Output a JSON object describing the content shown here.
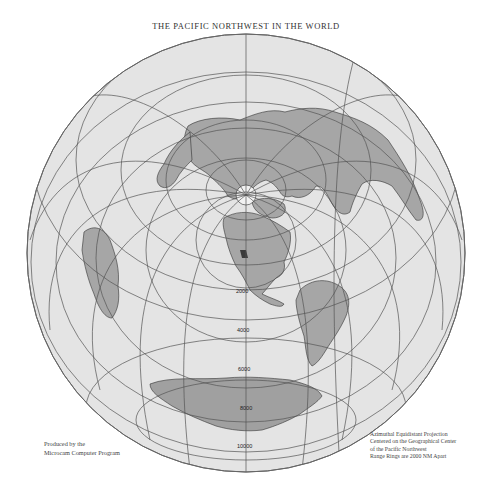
{
  "title": "THE PACIFIC NORTHWEST IN THE WORLD",
  "credit": {
    "line1": "Produced by the",
    "line2": "Microcam Computer Program"
  },
  "legend": {
    "line1": "Azimuthal Equidistant Projection",
    "line2": "Centered on the Geographical Center",
    "line3": "of the Pacific Northwest",
    "line4": "Range Rings are 2000 NM Apart"
  },
  "range_rings": {
    "labels": [
      "2000",
      "4000",
      "6000",
      "8000",
      "10000"
    ],
    "unit": "N.M."
  },
  "colors": {
    "ocean": "#e4e4e4",
    "land": "#a4a4a4",
    "land_dark": "#8c8c8c",
    "highlight": "#3c3c3c",
    "grid": "#555555"
  }
}
